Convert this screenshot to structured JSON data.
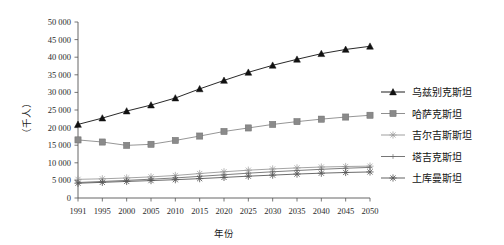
{
  "chart_data": {
    "type": "line",
    "title": "",
    "xlabel": "年份",
    "ylabel": "（千人）",
    "categories": [
      "1991",
      "1995",
      "2000",
      "2005",
      "2010",
      "2015",
      "2020",
      "2025",
      "2030",
      "2035",
      "2040",
      "2045",
      "2050"
    ],
    "x": [
      1991,
      1995,
      2000,
      2005,
      2010,
      2015,
      2020,
      2025,
      2030,
      2035,
      2040,
      2045,
      2050
    ],
    "ylim": [
      0,
      50000
    ],
    "xlim": [
      1991,
      2050
    ],
    "yticks": [
      "0",
      "5 000",
      "10 000",
      "15 000",
      "20 000",
      "25 000",
      "30 000",
      "35 000",
      "40 000",
      "45 000",
      "50 000"
    ],
    "ytick_values": [
      0,
      5000,
      10000,
      15000,
      20000,
      25000,
      30000,
      35000,
      40000,
      45000,
      50000
    ],
    "grid": false,
    "legend_position": "right",
    "series": [
      {
        "name": "乌兹别克斯坦",
        "marker": "filled-triangle",
        "color": "#111111",
        "values": [
          20900,
          22700,
          24700,
          26400,
          28400,
          31000,
          33400,
          35700,
          37700,
          39400,
          41000,
          42200,
          43100
        ]
      },
      {
        "name": "哈萨克斯坦",
        "marker": "filled-square",
        "color": "#8a8a8a",
        "values": [
          16500,
          15900,
          14950,
          15250,
          16350,
          17600,
          18900,
          19900,
          20900,
          21700,
          22400,
          23000,
          23500
        ]
      },
      {
        "name": "吉尔吉斯斯坦",
        "marker": "star-light",
        "color": "#9a9a9a",
        "values": [
          5300,
          5450,
          5700,
          6000,
          6400,
          6950,
          7450,
          7900,
          8250,
          8550,
          8800,
          8950,
          9050
        ]
      },
      {
        "name": "塔吉克斯坦",
        "marker": "plus-thin",
        "color": "#6f6f6f",
        "values": [
          4400,
          4700,
          5000,
          5350,
          5700,
          6150,
          6600,
          7050,
          7450,
          7800,
          8150,
          8450,
          8700
        ]
      },
      {
        "name": "土库曼斯坦",
        "marker": "star-dark",
        "color": "#5a5a5a",
        "values": [
          4200,
          4450,
          4700,
          4950,
          5200,
          5500,
          5850,
          6200,
          6500,
          6800,
          7050,
          7250,
          7400
        ]
      }
    ]
  },
  "axes": {
    "y_axis_title": "（千人）",
    "x_axis_title": "年份"
  }
}
